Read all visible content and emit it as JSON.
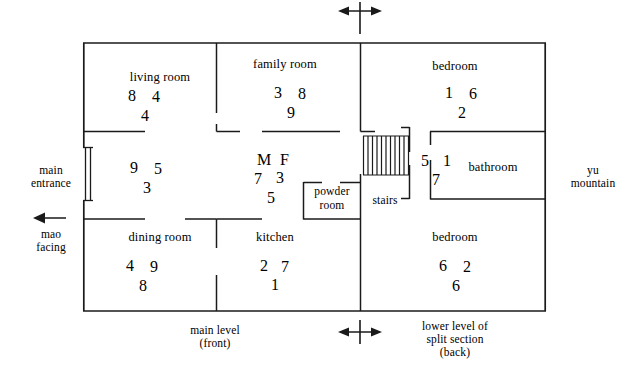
{
  "diagram": {
    "compass_arrows": {
      "top_label": "",
      "bottom_left_label": "",
      "bottom_right_label": ""
    },
    "exterior_notes": {
      "main_entrance": "main\nentrance",
      "main_entrance_line1": "main",
      "main_entrance_line2": "entrance",
      "mao_facing_line1": "mao",
      "mao_facing_line2": "facing",
      "yu_mountain_line1": "yu",
      "yu_mountain_line2": "mountain",
      "main_level_line1": "main level",
      "main_level_line2": "(front)",
      "lower_level_line1": "lower level of",
      "lower_level_line2": "split section",
      "lower_level_line3": "(back)"
    },
    "rooms": [
      {
        "name": "living room",
        "stars": {
          "mountain": "8",
          "water": "4",
          "period": "4"
        }
      },
      {
        "name": "family room",
        "stars": {
          "mountain": "3",
          "water": "8",
          "period": "9"
        }
      },
      {
        "name": "bedroom",
        "stars": {
          "mountain": "1",
          "water": "6",
          "period": "2"
        }
      },
      {
        "name": "",
        "stars": {
          "mountain": "9",
          "water": "5",
          "period": "3"
        }
      },
      {
        "name": "",
        "stars": {
          "mountain": "M",
          "water": "F",
          "m2": "7",
          "w2": "3",
          "period": "5"
        }
      },
      {
        "name": "powder\nroom",
        "label_line1": "powder",
        "label_line2": "room",
        "stars": {}
      },
      {
        "name": "stairs",
        "stars": {
          "mountain": "5",
          "water": "1",
          "period": "7"
        }
      },
      {
        "name": "bathroom",
        "stars": {}
      },
      {
        "name": "dining room",
        "stars": {
          "mountain": "4",
          "water": "9",
          "period": "8"
        }
      },
      {
        "name": "kitchen",
        "stars": {
          "mountain": "2",
          "water": "7",
          "period": "1"
        }
      },
      {
        "name": "bedroom",
        "stars": {
          "mountain": "6",
          "water": "2",
          "period": "6"
        }
      }
    ],
    "colors": {
      "wall": "#1a1a1a",
      "text": "#000000",
      "background": "#ffffff"
    }
  }
}
